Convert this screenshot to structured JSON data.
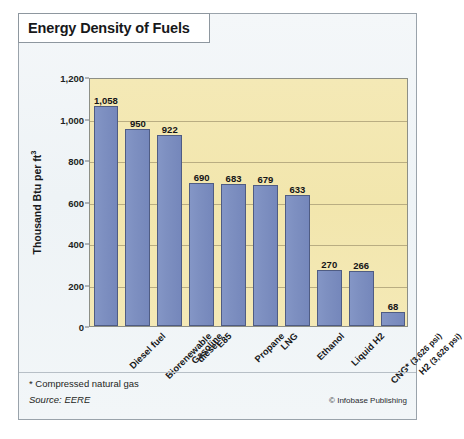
{
  "figure": {
    "title": "Energy Density of Fuels",
    "footnote": "* Compressed natural gas",
    "source": "Source: EERE",
    "credit": "© Infobase Publishing"
  },
  "chart_data": {
    "type": "bar",
    "title": "Energy Density of Fuels",
    "xlabel": "",
    "ylabel": "Thousand Btu per ft³",
    "ylim": [
      0,
      1200
    ],
    "yticks": [
      0,
      200,
      400,
      600,
      800,
      1000,
      1200
    ],
    "ytick_labels": [
      "0",
      "200",
      "400",
      "600",
      "800",
      "1,000",
      "1,200"
    ],
    "grid": true,
    "legend": null,
    "categories": [
      "Diesel fuel",
      "Biorenewable diesel",
      "Gasoline",
      "E85",
      "Propane",
      "LNG",
      "Ethanol",
      "Liquid H2",
      "CNG* (3,626 psi)",
      "H2 (3,626 psi)"
    ],
    "values": [
      1058,
      950,
      922,
      690,
      683,
      679,
      633,
      270,
      266,
      68
    ],
    "value_labels": [
      "1,058",
      "950",
      "922",
      "690",
      "683",
      "679",
      "633",
      "270",
      "266",
      "68"
    ],
    "colors": {
      "bar_fill": "#7e90c1",
      "bar_stroke": "#4f5c83",
      "plot_background": "#f2e6ad",
      "gridline": "#b9ad82",
      "figure_background": "#eef3f6"
    }
  },
  "x_labels": [
    {
      "line1": "Diesel fuel",
      "line2": ""
    },
    {
      "line1": "Biorenewable",
      "line2": "diesel"
    },
    {
      "line1": "Gasoline",
      "line2": ""
    },
    {
      "line1": "E85",
      "line2": ""
    },
    {
      "line1": "Propane",
      "line2": ""
    },
    {
      "line1": "LNG",
      "line2": ""
    },
    {
      "line1": "Ethanol",
      "line2": ""
    },
    {
      "line1": "Liquid H2",
      "line2": ""
    },
    {
      "line1": "CNG* (3,626 psi)",
      "line2": ""
    },
    {
      "line1": "H2 (3,626 psi)",
      "line2": ""
    }
  ]
}
